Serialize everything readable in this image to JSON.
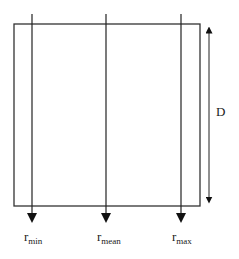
{
  "diagram": {
    "box": {
      "x": 14,
      "y": 24,
      "width": 186,
      "height": 182,
      "stroke": "#333333"
    },
    "rays": [
      {
        "name": "r-min",
        "x": 32,
        "label_main": "r",
        "label_sub": "min"
      },
      {
        "name": "r-mean",
        "x": 106,
        "label_main": "r",
        "label_sub": "mean"
      },
      {
        "name": "r-max",
        "x": 181,
        "label_main": "r",
        "label_sub": "max"
      }
    ],
    "dimension": {
      "label": "D",
      "x": 209,
      "y_top": 25,
      "y_bottom": 203
    }
  },
  "labels": {
    "r_min_main": "r",
    "r_min_sub": "min",
    "r_mean_main": "r",
    "r_mean_sub": "mean",
    "r_max_main": "r",
    "r_max_sub": "max",
    "dimension": "D"
  }
}
